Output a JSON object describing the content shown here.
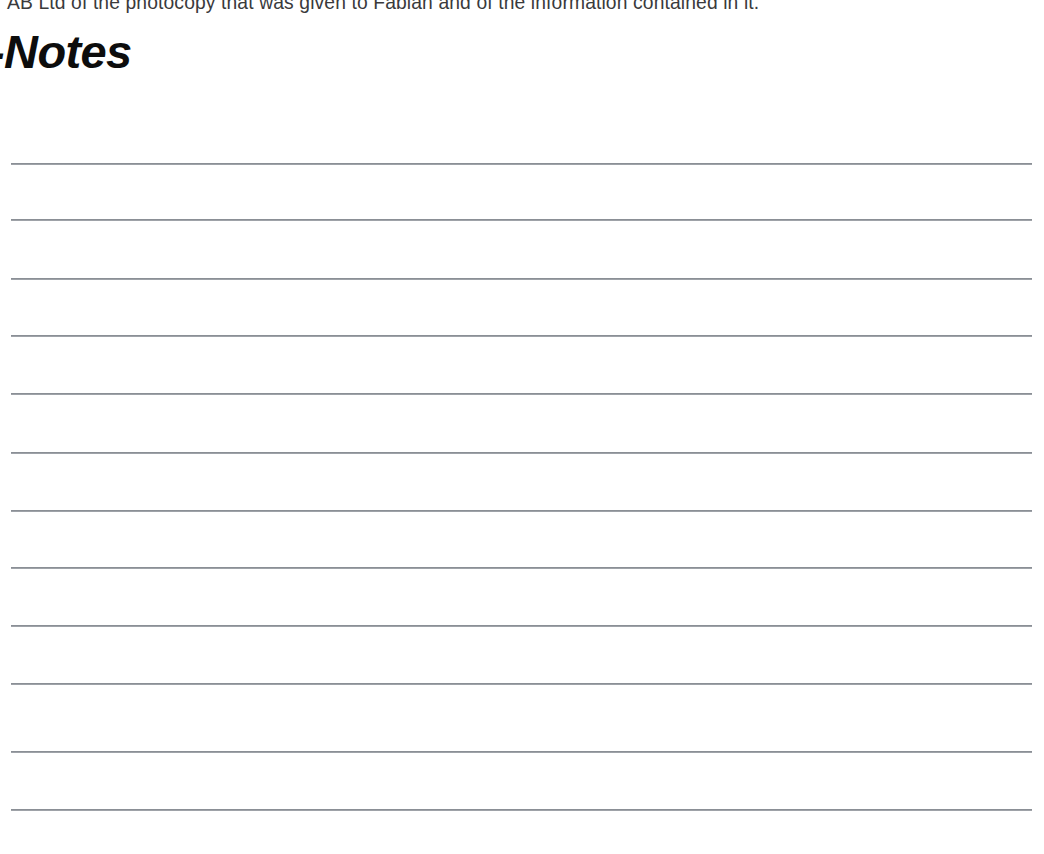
{
  "page": {
    "background_color": "#ffffff",
    "width": 1044,
    "height": 854
  },
  "body_text": {
    "line": "AB Ltd of the photocopy that was given to Fabian and of the information contained in it.",
    "color": "#3a3a3c",
    "clipped_at_top": true
  },
  "heading": {
    "text": "-Notes",
    "style": "bold-italic",
    "color": "#0d0d0d",
    "clipped_at_left": true
  },
  "note_lines": {
    "count": 12,
    "color": "#7e838a",
    "left": 11,
    "right": 1032,
    "y_positions": [
      163,
      219,
      278,
      335,
      393,
      452,
      510,
      567,
      625,
      683,
      751,
      809
    ],
    "values": [
      "",
      "",
      "",
      "",
      "",
      "",
      "",
      "",
      "",
      "",
      "",
      ""
    ]
  }
}
